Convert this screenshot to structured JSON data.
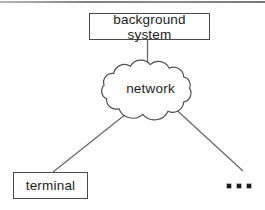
{
  "nodes": {
    "background_system": {
      "label": "background system"
    },
    "network": {
      "label": "network"
    },
    "terminal": {
      "label": "terminal"
    }
  },
  "ellipsis": {
    "icon": "three-dots",
    "text": "..."
  },
  "edges": [
    {
      "from": "background_system",
      "to": "network",
      "style": "vertical-line"
    },
    {
      "from": "network",
      "to": "terminal",
      "style": "diagonal-line"
    },
    {
      "from": "network",
      "to": "more-terminals-ellipsis",
      "style": "diagonal-line"
    }
  ],
  "colors": {
    "line": "#6a6a6a",
    "box_border": "#4a4a4a",
    "cloud_border": "#4f4f4f",
    "text": "#1d1d1d",
    "top_rule": "#8a8a8a",
    "background": "#fefefe"
  }
}
